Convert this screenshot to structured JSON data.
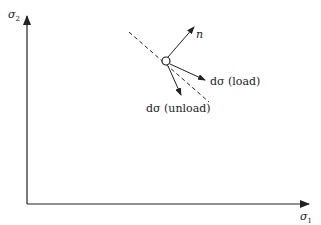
{
  "diagram": {
    "axes": {
      "y_label": "σ",
      "y_sub": "2",
      "x_label": "σ",
      "x_sub": "1"
    },
    "vectors": {
      "normal_label": "n",
      "load_label": "dσ (load)",
      "unload_label": "dσ (unload)"
    },
    "elements": {
      "yield_surface_tangent": "dashed line",
      "stress_point": "open circle"
    },
    "colors": {
      "ink": "#222222",
      "background": "#ffffff"
    }
  }
}
